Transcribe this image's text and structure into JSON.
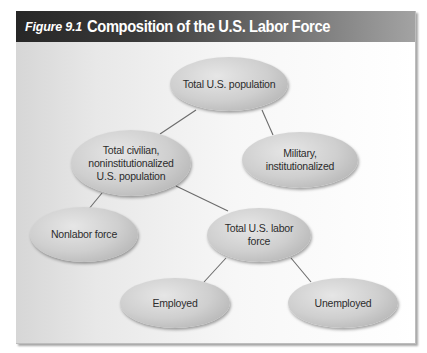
{
  "figure": {
    "label": "Figure 9.1",
    "title": "Composition of the U.S. Labor Force"
  },
  "nodes": {
    "total_population": "Total U.S. population",
    "civilian": "Total civilian, noninstitutionalized U.S. population",
    "military": "Military, institutionalized",
    "nonlabor": "Nonlabor force",
    "labor_force": "Total U.S. labor force",
    "employed": "Employed",
    "unemployed": "Unemployed"
  },
  "edges": [
    [
      "total_population",
      "civilian"
    ],
    [
      "total_population",
      "military"
    ],
    [
      "civilian",
      "nonlabor"
    ],
    [
      "civilian",
      "labor_force"
    ],
    [
      "labor_force",
      "employed"
    ],
    [
      "labor_force",
      "unemployed"
    ]
  ],
  "colors": {
    "header_dark": "#262626",
    "header_light": "#a3a3a3",
    "node_fill": "#cfcfcf",
    "line": "#6b6b6b"
  }
}
